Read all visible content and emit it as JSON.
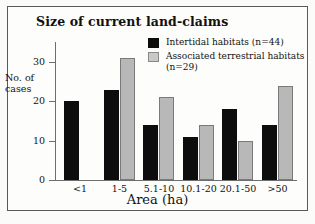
{
  "chart_data": {
    "type": "bar",
    "title": "Size of current land-claims",
    "xlabel": "Area (ha)",
    "ylabel": "No. of cases",
    "categories": [
      "<1",
      "1-5",
      "5.1-10",
      "10.1-20",
      "20.1-50",
      ">50"
    ],
    "series": [
      {
        "name": "Intertidal habitats (n=44)",
        "color": "#0d0d0d",
        "values": [
          20,
          23,
          14,
          11,
          18,
          14
        ]
      },
      {
        "name": "Associated terrestrial habitats (n=29)",
        "color": "#b8b8b8",
        "values": [
          0,
          31,
          21,
          14,
          10,
          24
        ]
      }
    ],
    "ylim": [
      0,
      33
    ],
    "yticks": [
      0,
      10,
      20,
      30
    ],
    "ytick_labels": [
      "0",
      "10",
      "20",
      "30"
    ],
    "grid": false,
    "legend_position": "top-right"
  },
  "legend": {
    "entries": [
      {
        "label": "Intertidal habitats (n=44)"
      },
      {
        "label": "Associated terrestrial habitats (n=29)"
      }
    ]
  }
}
